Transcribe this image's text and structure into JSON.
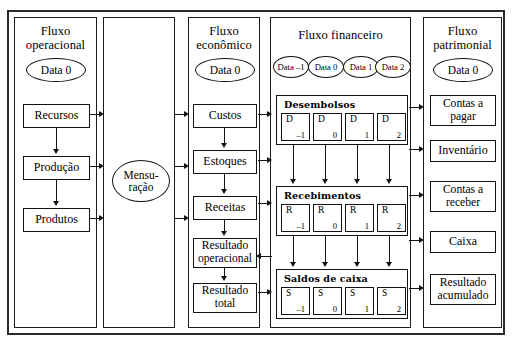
{
  "diagram": {
    "columns": {
      "operacional": {
        "title_line1": "Fluxo",
        "title_line2": "operacional",
        "date_label": "Data 0",
        "boxes": [
          {
            "label": "Recursos"
          },
          {
            "label": "Produção"
          },
          {
            "label": "Produtos"
          }
        ]
      },
      "mensuracao": {
        "title_line1": "",
        "title_line2": "",
        "ellipse_line1": "Mensu-",
        "ellipse_line2": "ração"
      },
      "economico": {
        "title_line1": "Fluxo",
        "title_line2": "econômico",
        "date_label": "Data 0",
        "boxes": [
          {
            "label": "Custos"
          },
          {
            "label": "Estoques"
          },
          {
            "label": "Receitas"
          },
          {
            "label_line1": "Resultado",
            "label_line2": "operacional"
          },
          {
            "label_line1": "Resultado",
            "label_line2": "total"
          }
        ]
      },
      "financeiro": {
        "title": "Fluxo financeiro",
        "dates": [
          "Data –1",
          "Data 0",
          "Data 1",
          "Data 2"
        ],
        "groups": [
          {
            "title": "Desembolsos",
            "cells": [
              {
                "letter": "D",
                "index": "–1"
              },
              {
                "letter": "D",
                "index": "0"
              },
              {
                "letter": "D",
                "index": "1"
              },
              {
                "letter": "D",
                "index": "2"
              }
            ]
          },
          {
            "title": "Recebimentos",
            "cells": [
              {
                "letter": "R",
                "index": "–1"
              },
              {
                "letter": "R",
                "index": "0"
              },
              {
                "letter": "R",
                "index": "1"
              },
              {
                "letter": "R",
                "index": "2"
              }
            ]
          },
          {
            "title": "Saldos de caixa",
            "cells": [
              {
                "letter": "S",
                "index": "–1"
              },
              {
                "letter": "S",
                "index": "0"
              },
              {
                "letter": "S",
                "index": "1"
              },
              {
                "letter": "S",
                "index": "2"
              }
            ]
          }
        ]
      },
      "patrimonial": {
        "title_line1": "Fluxo",
        "title_line2": "patrimonial",
        "date_label": "Data 0",
        "boxes": [
          {
            "label_line1": "Contas a",
            "label_line2": "pagar"
          },
          {
            "label_line1": "Inventário",
            "label_line2": ""
          },
          {
            "label_line1": "Contas a",
            "label_line2": "receber"
          },
          {
            "label_line1": "Caixa",
            "label_line2": ""
          },
          {
            "label_line1": "Resultado",
            "label_line2": "acumulado"
          }
        ]
      }
    },
    "colors": {
      "line": "#141414",
      "border": "#121212",
      "background": "#ffffff"
    }
  }
}
